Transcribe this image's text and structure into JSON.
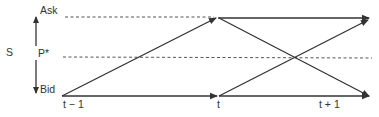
{
  "diagram": {
    "spread_label": "S",
    "levels": {
      "ask": "Ask",
      "mid": "P*",
      "bid": "Bid"
    },
    "time_labels": [
      "t − 1",
      "t",
      "t + 1"
    ],
    "colors": {
      "line": "#333333",
      "dashed": "#555555",
      "background": "#ffffff"
    },
    "edges": [
      {
        "from": "bid@t-1",
        "to": "bid@t",
        "style": "solid-arrow"
      },
      {
        "from": "bid@t-1",
        "to": "ask@t",
        "style": "solid-arrow"
      },
      {
        "from": "ask@t",
        "to": "ask@t+1",
        "style": "solid-arrow"
      },
      {
        "from": "ask@t",
        "to": "bid@t+1",
        "style": "solid-arrow"
      },
      {
        "from": "bid@t",
        "to": "ask@t+1",
        "style": "solid-arrow"
      },
      {
        "from": "bid@t",
        "to": "bid@t+1",
        "style": "solid-arrow"
      }
    ]
  }
}
